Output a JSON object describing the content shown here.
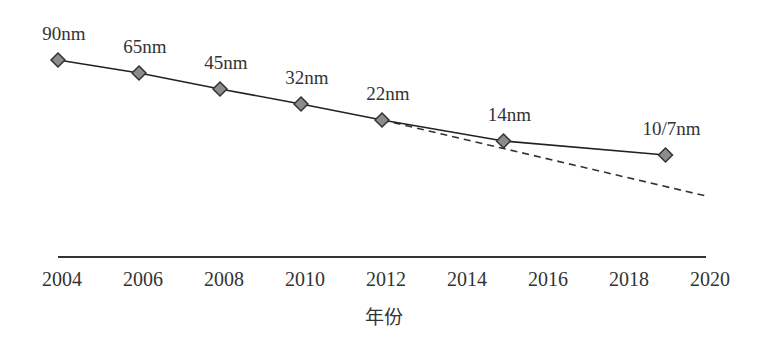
{
  "chart_data": {
    "type": "line",
    "title": "",
    "xlabel": "年份",
    "ylabel": "",
    "xlim": [
      2004,
      2020
    ],
    "x_ticks": [
      "2004",
      "2006",
      "2008",
      "2010",
      "2012",
      "2014",
      "2016",
      "2018",
      "2020"
    ],
    "grid": false,
    "legend": null,
    "series": [
      {
        "name": "Process node (actual)",
        "style": "solid",
        "marker": "diamond",
        "x": [
          2004,
          2006,
          2008,
          2010,
          2012,
          2015,
          2019
        ],
        "labels": [
          "90nm",
          "65nm",
          "45nm",
          "32nm",
          "22nm",
          "14nm",
          "10/7nm"
        ],
        "y_pixel_relative": [
          60,
          73,
          89,
          104,
          120,
          141,
          155
        ]
      },
      {
        "name": "Trend extrapolation",
        "style": "dashed",
        "x": [
          2012,
          2020
        ],
        "y_pixel_relative": [
          120,
          196
        ]
      }
    ]
  },
  "colors": {
    "line": "#222222",
    "marker_fill": "#8c8c8c",
    "marker_stroke": "#333333",
    "axis": "#333333",
    "text": "#333333"
  }
}
